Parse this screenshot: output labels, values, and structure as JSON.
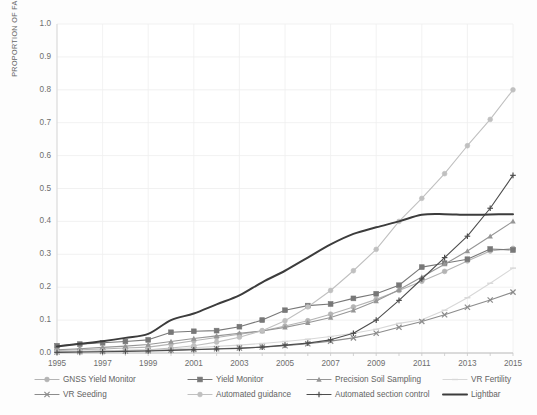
{
  "chart_data": {
    "type": "line",
    "title": "",
    "xlabel": "",
    "ylabel": "PROPORTION OF FARMS",
    "xlim": [
      1995,
      2015
    ],
    "ylim": [
      0.0,
      1.0
    ],
    "grid": true,
    "legend_position": "bottom",
    "x": [
      1995,
      1996,
      1997,
      1998,
      1999,
      2000,
      2001,
      2002,
      2003,
      2004,
      2005,
      2006,
      2007,
      2008,
      2009,
      2010,
      2011,
      2012,
      2013,
      2014,
      2015
    ],
    "xticklabels": [
      "1995",
      "1997",
      "1999",
      "2001",
      "2003",
      "2005",
      "2007",
      "2009",
      "2011",
      "2013",
      "2015"
    ],
    "yticklabels": [
      "0.0",
      "0.1",
      "0.2",
      "0.3",
      "0.4",
      "0.5",
      "0.6",
      "0.7",
      "0.8",
      "0.9",
      "1.0"
    ],
    "series": [
      {
        "name": "GNSS Yield Monitor",
        "color": "#b4b4b4",
        "marker": "circle",
        "values": [
          0.008,
          0.01,
          0.012,
          0.015,
          0.018,
          0.027,
          0.037,
          0.047,
          0.057,
          0.067,
          0.082,
          0.098,
          0.118,
          0.14,
          0.163,
          0.19,
          0.218,
          0.248,
          0.28,
          0.31,
          0.318
        ]
      },
      {
        "name": "Yield Monitor",
        "color": "#787878",
        "marker": "square",
        "values": [
          0.022,
          0.027,
          0.031,
          0.035,
          0.04,
          0.063,
          0.066,
          0.068,
          0.08,
          0.1,
          0.13,
          0.144,
          0.149,
          0.166,
          0.18,
          0.206,
          0.261,
          0.273,
          0.285,
          0.316,
          0.313
        ]
      },
      {
        "name": "Precision Soil Sampling",
        "color": "#969696",
        "marker": "triangle",
        "values": [
          0.01,
          0.013,
          0.017,
          0.021,
          0.026,
          0.035,
          0.044,
          0.052,
          0.06,
          0.067,
          0.078,
          0.092,
          0.108,
          0.13,
          0.158,
          0.192,
          0.231,
          0.27,
          0.31,
          0.355,
          0.4
        ]
      },
      {
        "name": "VR Fertility",
        "color": "#d8d8d8",
        "marker": "dash",
        "values": [
          0.004,
          0.005,
          0.006,
          0.007,
          0.009,
          0.012,
          0.016,
          0.02,
          0.024,
          0.029,
          0.035,
          0.042,
          0.05,
          0.06,
          0.072,
          0.09,
          0.101,
          0.13,
          0.168,
          0.212,
          0.258
        ]
      },
      {
        "name": "VR Seeding",
        "color": "#8c8c8c",
        "marker": "x",
        "values": [
          0.003,
          0.004,
          0.005,
          0.006,
          0.007,
          0.009,
          0.011,
          0.013,
          0.015,
          0.018,
          0.022,
          0.028,
          0.036,
          0.046,
          0.06,
          0.078,
          0.096,
          0.116,
          0.139,
          0.161,
          0.185
        ]
      },
      {
        "name": "Automated guidance",
        "color": "#c0c0c0",
        "marker": "circle",
        "values": [
          0.004,
          0.005,
          0.006,
          0.008,
          0.01,
          0.015,
          0.022,
          0.033,
          0.048,
          0.068,
          0.098,
          0.14,
          0.19,
          0.25,
          0.315,
          0.4,
          0.47,
          0.545,
          0.63,
          0.71,
          0.8
        ]
      },
      {
        "name": "Automated section control",
        "color": "#4d4d4d",
        "marker": "plus",
        "values": [
          0.002,
          0.003,
          0.004,
          0.005,
          0.006,
          0.008,
          0.01,
          0.012,
          0.014,
          0.018,
          0.024,
          0.03,
          0.04,
          0.06,
          0.1,
          0.16,
          0.225,
          0.29,
          0.355,
          0.44,
          0.54
        ]
      },
      {
        "name": "Lightbar",
        "color": "#3c3c3c",
        "marker": "none",
        "values": [
          0.02,
          0.028,
          0.036,
          0.046,
          0.058,
          0.1,
          0.12,
          0.148,
          0.175,
          0.215,
          0.25,
          0.29,
          0.33,
          0.362,
          0.382,
          0.4,
          0.42,
          0.422,
          0.42,
          0.421,
          0.422
        ]
      }
    ]
  },
  "axes": {
    "yaxis_title": "PROPORTION OF FARMS"
  },
  "legend": {
    "rows": [
      [
        "GNSS Yield Monitor",
        "Yield Monitor",
        "Precision Soil Sampling",
        "VR Fertility"
      ],
      [
        "VR Seeding",
        "Automated guidance",
        "Automated section control",
        "Lightbar"
      ]
    ]
  }
}
